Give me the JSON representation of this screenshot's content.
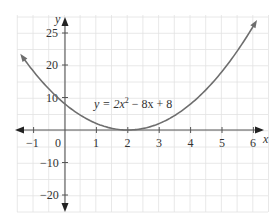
{
  "chart_data": {
    "type": "line",
    "title": "",
    "xlabel": "x",
    "ylabel": "y",
    "equation": "y = 2x² − 8x + 8",
    "equation_parts": {
      "lhs": "y = 2x",
      "exp": "2",
      "rhs": " − 8x + 8"
    },
    "x_ticks": [
      "−1",
      "0",
      "1",
      "2",
      "3",
      "4",
      "5",
      "6"
    ],
    "y_ticks": [
      "25",
      "20",
      "10",
      "−10",
      "−20"
    ],
    "xlim": [
      -1.5,
      6.5
    ],
    "ylim": [
      -25,
      30
    ],
    "grid": true,
    "series": [
      {
        "name": "y = 2x^2 - 8x + 8",
        "x": [
          -1.4,
          -1,
          0,
          1,
          2,
          3,
          4,
          5,
          6.1
        ],
        "y": [
          22.72,
          18,
          8,
          2,
          0,
          2,
          8,
          18,
          33.62
        ]
      }
    ],
    "colors": {
      "curve": "#6e6e6e",
      "axis": "#555555",
      "grid": "#e2e2e2"
    }
  }
}
